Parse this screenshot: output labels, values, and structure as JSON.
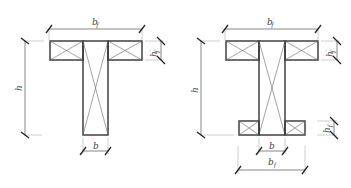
{
  "diagram": {
    "type": "cross-section dimension diagram",
    "colors": {
      "stroke": "#333333",
      "thin": "#555555",
      "ext": "#999999",
      "background": "#ffffff"
    },
    "figures": [
      {
        "name": "t-section",
        "labels": {
          "top_width": {
            "main": "b",
            "sup": "′",
            "sub": "f"
          },
          "flange_height": {
            "main": "h",
            "sup": "′",
            "sub": "f"
          },
          "height": {
            "main": "h"
          },
          "web_width": {
            "main": "b"
          }
        }
      },
      {
        "name": "i-section",
        "labels": {
          "top_width": {
            "main": "b",
            "sup": "′",
            "sub": "f"
          },
          "top_flange_height": {
            "main": "h",
            "sup": "′",
            "sub": "f"
          },
          "height": {
            "main": "h"
          },
          "web_width": {
            "main": "b"
          },
          "bottom_flange_height": {
            "main": "h",
            "sub": "f"
          },
          "bottom_width": {
            "main": "b",
            "sub": "f"
          }
        }
      }
    ]
  }
}
